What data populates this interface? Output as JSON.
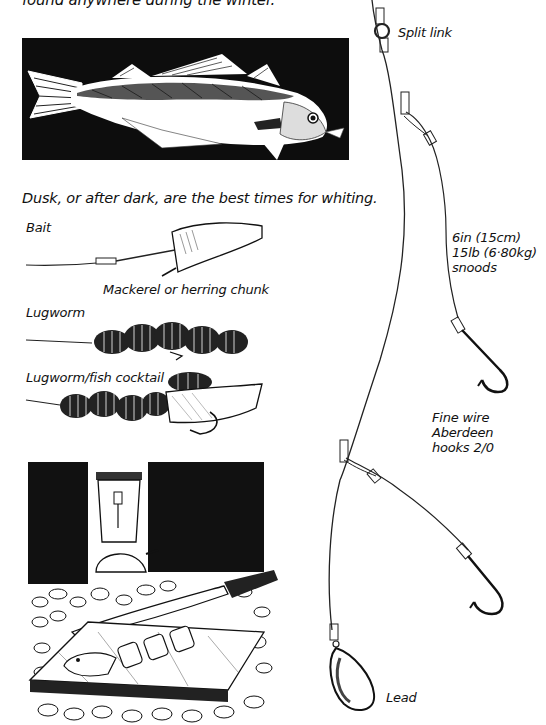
{
  "page": {
    "intro_text_fragment": "found anywhere during the winter.",
    "fish_illustration": {
      "subject": "whiting",
      "caption": "Dusk, or after dark, are the best times for whiting."
    },
    "bait_section": {
      "heading": "Bait",
      "items": [
        {
          "label": "Mackerel or herring chunk"
        },
        {
          "label": "Lugworm"
        },
        {
          "label": "Lugworm/fish cocktail"
        }
      ]
    },
    "night_scene": {
      "subject": "lantern, knife and sliced fish on cutting board over pebbles"
    },
    "rig_diagram": {
      "labels": {
        "split_link": "Split link",
        "snoods_line1": "6in (15cm)",
        "snoods_line2": "15lb (6·80kg)",
        "snoods_line3": "snoods",
        "hooks_line1": "Fine wire",
        "hooks_line2": "Aberdeen",
        "hooks_line3": "hooks 2/0",
        "lead": "Lead"
      }
    }
  },
  "colors": {
    "ink": "#111111",
    "paper": "#ffffff",
    "panel": "#0d0d0d"
  }
}
